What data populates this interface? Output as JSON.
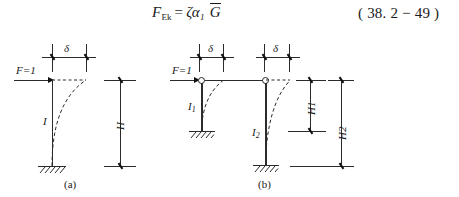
{
  "formula": {
    "lhs": "F",
    "lhs_sub": "Ek",
    "equals": "=",
    "zeta": "ζ",
    "alpha": "α",
    "alpha_sub": "1",
    "g_symbol": "G",
    "full_text": "F_Ek = ζα₁ Ḡ",
    "equation_number": "( 38. 2 − 49 )"
  },
  "diagrams": [
    {
      "id": "a",
      "caption": "(a)",
      "load_label": "F=1",
      "displacement_label": "δ",
      "column_labels": [
        "I"
      ],
      "height_labels": [
        "H"
      ],
      "supports": [
        "fixed"
      ],
      "hinges": 0
    },
    {
      "id": "b",
      "caption": "(b)",
      "load_label": "F=1",
      "displacement_label": "δ",
      "displacement_label_2": "δ",
      "column_labels": [
        "I",
        "I"
      ],
      "column_label_subs": [
        "1",
        "2"
      ],
      "height_labels": [
        "H",
        "H"
      ],
      "height_label_subs": [
        "1",
        "2"
      ],
      "supports": [
        "fixed",
        "fixed"
      ],
      "hinges": 2
    }
  ],
  "colors": {
    "ink": "#2b2b2b",
    "background": "#ffffff"
  }
}
